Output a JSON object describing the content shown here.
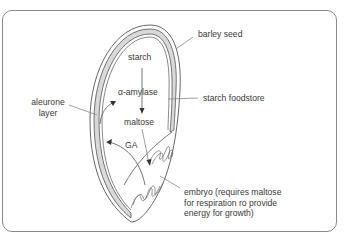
{
  "diagram": {
    "labels": {
      "barley_seed": "barley seed",
      "starch": "starch",
      "alpha_amylase": "α-amylase",
      "starch_foodstore": "starch foodstore",
      "aleurone_line1": "aleurone",
      "aleurone_line2": "layer",
      "maltose": "maltose",
      "ga": "GA",
      "embryo_line1": "embryo (requires maltose",
      "embryo_line2": "for respiration ro provide",
      "embryo_line3": "energy for growth)"
    },
    "colors": {
      "frame": "#8a8a8a",
      "line": "#555555",
      "aleurone_fill": "#d9d9d9",
      "text": "#3a3a3a"
    }
  }
}
